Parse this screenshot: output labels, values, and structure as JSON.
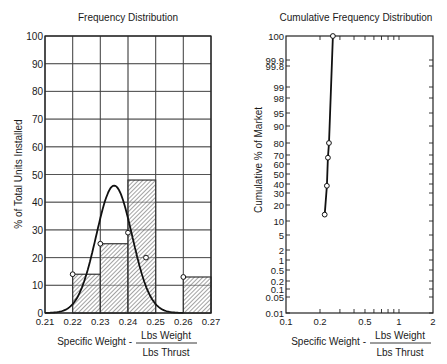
{
  "chart_data": [
    {
      "type": "bar",
      "title": "Frequency Distribution",
      "xlabel": "Specific Weight -",
      "xlabel_fraction": {
        "numerator": "Lbs Weight",
        "denominator": "Lbs Thrust"
      },
      "ylabel": "% of Total Units Installed",
      "xlim": [
        0.21,
        0.27
      ],
      "ylim": [
        0,
        100
      ],
      "grid": true,
      "x_ticks": [
        "0.21",
        "0.22",
        "0.23",
        "0.24",
        "0.25",
        "0.26",
        "0.27"
      ],
      "y_ticks": [
        "0",
        "10",
        "20",
        "30",
        "40",
        "50",
        "60",
        "70",
        "80",
        "90",
        "100"
      ],
      "bins": [
        {
          "from": 0.22,
          "to": 0.23,
          "value": 14
        },
        {
          "from": 0.23,
          "to": 0.24,
          "value": 25
        },
        {
          "from": 0.24,
          "to": 0.25,
          "value": 48
        },
        {
          "from": 0.25,
          "to": 0.26,
          "value": 0
        },
        {
          "from": 0.26,
          "to": 0.27,
          "value": 13
        }
      ],
      "points": [
        {
          "x": 0.22,
          "y": 14
        },
        {
          "x": 0.23,
          "y": 25
        },
        {
          "x": 0.24,
          "y": 29
        },
        {
          "x": 0.2465,
          "y": 20
        },
        {
          "x": 0.26,
          "y": 13
        }
      ],
      "fitted_curve": {
        "type": "normal",
        "mean": 0.235,
        "peak": 46,
        "sigma": 0.0065,
        "x_range": [
          0.21,
          0.26
        ]
      }
    },
    {
      "type": "line",
      "title": "Cumulative Frequency Distribution",
      "xlabel": "Specific Weight -",
      "xlabel_fraction": {
        "numerator": "Lbs Weight",
        "denominator": "Lbs Thrust"
      },
      "ylabel": "Cumulative % of Market",
      "x_scale": "log",
      "y_scale": "probability",
      "xlim": [
        0.1,
        2
      ],
      "ylim": [
        0.01,
        100
      ],
      "grid": false,
      "x_ticks": [
        "0.1",
        "0.2",
        "0.5",
        "1",
        "2"
      ],
      "y_ticks": [
        "0.01",
        "0.05",
        "0.1",
        "0.2",
        "0.5",
        "1",
        "2",
        "5",
        "10",
        "20",
        "30",
        "40",
        "50",
        "60",
        "70",
        "80",
        "90",
        "95",
        "98",
        "99",
        "99.8",
        "99.9",
        "100"
      ],
      "points": [
        {
          "x": 0.22,
          "y": 14
        },
        {
          "x": 0.23,
          "y": 38
        },
        {
          "x": 0.235,
          "y": 67
        },
        {
          "x": 0.24,
          "y": 80
        },
        {
          "x": 0.26,
          "y": 100
        }
      ]
    }
  ]
}
